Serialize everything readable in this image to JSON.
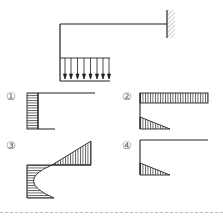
{
  "diagram": {
    "type": "frame-moment-diagram-question",
    "structure": {
      "description": "Cantilever L-frame fixed at right wall, uniformly distributed load on lower horizontal member",
      "support": "fixed-wall",
      "load": "uniformly-distributed-downward",
      "arrow_count": 8
    },
    "options": [
      {
        "label": "①",
        "description": "Rectangular diagram on vertical member, no moment on beams"
      },
      {
        "label": "②",
        "description": "Rectangular diagram on top beam, triangular on lower member"
      },
      {
        "label": "③",
        "description": "Linear triangle on top beam, parabolic curve on vertical member"
      },
      {
        "label": "④",
        "description": "Triangular diagram on lower member only"
      }
    ]
  },
  "colors": {
    "line": "#222222",
    "hatch": "#333333",
    "label": "#666666",
    "wall_hatch": "#888888"
  }
}
